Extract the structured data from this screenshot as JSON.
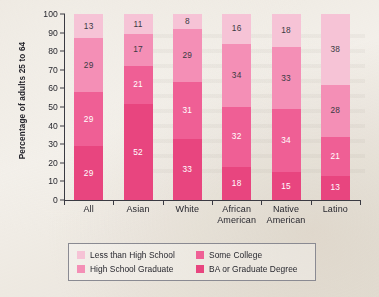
{
  "chart_data": {
    "type": "bar",
    "subtype": "stacked-bar-100",
    "title": "",
    "xlabel": "",
    "ylabel": "Percentage of adults 25 to 64",
    "ylim": [
      0,
      100
    ],
    "ytick_step": 10,
    "yticks": [
      "100",
      "90",
      "80",
      "70",
      "60",
      "50",
      "40",
      "30",
      "20",
      "10",
      "0"
    ],
    "grid": false,
    "legend_position": "bottom",
    "categories": [
      "All",
      "Asian",
      "White",
      "African American",
      "Native American",
      "Latino"
    ],
    "category_lines": [
      [
        "All"
      ],
      [
        "Asian"
      ],
      [
        "White"
      ],
      [
        "African",
        "American"
      ],
      [
        "Native",
        "American"
      ],
      [
        "Latino"
      ]
    ],
    "series": [
      {
        "name": "Less than High School",
        "color": "#f6c3d6",
        "label_color": "#3a3a42",
        "values": [
          13,
          11,
          8,
          16,
          18,
          38
        ]
      },
      {
        "name": "High School Graduate",
        "color": "#f48fb6",
        "label_color": "#3a3a42",
        "values": [
          29,
          17,
          29,
          34,
          33,
          28
        ]
      },
      {
        "name": "Some College",
        "color": "#ef5f95",
        "label_color": "#ffffff",
        "values": [
          29,
          21,
          31,
          32,
          34,
          21
        ]
      },
      {
        "name": "BA or Graduate Degree",
        "color": "#e8457f",
        "label_color": "#ffffff",
        "values": [
          29,
          52,
          33,
          18,
          15,
          13
        ]
      }
    ]
  },
  "legend": {
    "items": [
      {
        "label": "Less than High School",
        "color": "#f6c3d6"
      },
      {
        "label": "Some College",
        "color": "#ef5f95"
      },
      {
        "label": "High School Graduate",
        "color": "#f48fb6"
      },
      {
        "label": "BA or Graduate Degree",
        "color": "#e8457f"
      }
    ]
  }
}
